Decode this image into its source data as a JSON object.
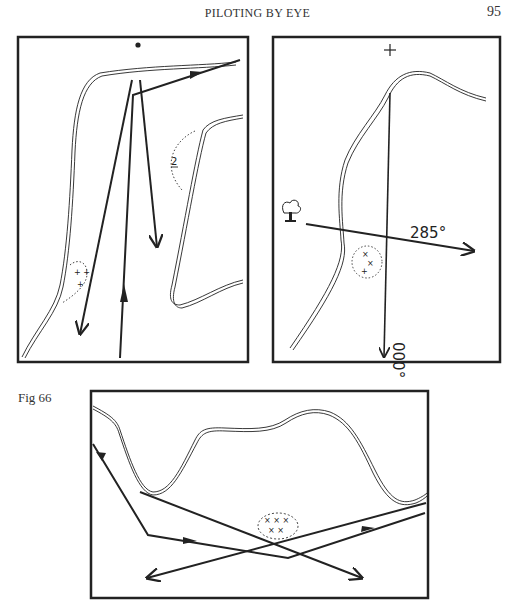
{
  "header": {
    "running_title": "PILOTING BY EYE",
    "page_number": "95"
  },
  "figure": {
    "label": "Fig 66",
    "panels": [
      {
        "id": "panel-1",
        "annotations": {
          "depth_label": "2",
          "top_marker": "dot"
        }
      },
      {
        "id": "panel-2",
        "annotations": {
          "bearing_east": "285°",
          "bearing_south": "000°",
          "top_marker": "+",
          "landmark": "tree"
        }
      },
      {
        "id": "panel-3",
        "annotations": {}
      }
    ]
  }
}
